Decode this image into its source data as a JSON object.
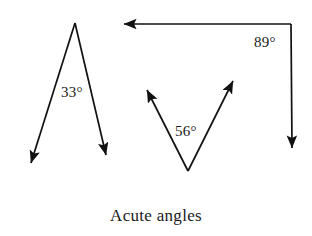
{
  "figure": {
    "caption": "Acute angles",
    "background_color": "#ffffff",
    "stroke_color": "#111111",
    "text_color": "#1a1a1a",
    "width": 312,
    "height": 236
  },
  "angles": [
    {
      "id": "angle-33",
      "label": "33°",
      "value": 33,
      "unit": "degrees",
      "shape": "narrow-v-inverted",
      "vertex": {
        "x": 75,
        "y": 23
      },
      "rays": [
        {
          "name": "left-ray",
          "tip": {
            "x": 28,
            "y": 166
          },
          "arrowhead": true
        },
        {
          "name": "right-ray",
          "tip": {
            "x": 108,
            "y": 159
          },
          "arrowhead": true
        }
      ],
      "label_position": {
        "x": 61,
        "y": 85
      }
    },
    {
      "id": "angle-56",
      "label": "56°",
      "value": 56,
      "unit": "degrees",
      "shape": "v-upright",
      "vertex": {
        "x": 188,
        "y": 171
      },
      "rays": [
        {
          "name": "left-ray",
          "tip": {
            "x": 145,
            "y": 86
          },
          "arrowhead": true
        },
        {
          "name": "right-ray",
          "tip": {
            "x": 236,
            "y": 77
          },
          "arrowhead": true
        }
      ],
      "label_position": {
        "x": 175,
        "y": 124
      }
    },
    {
      "id": "angle-89",
      "label": "89°",
      "value": 89,
      "unit": "degrees",
      "shape": "near-right-angle",
      "vertex": {
        "x": 291,
        "y": 24
      },
      "rays": [
        {
          "name": "horizontal-ray",
          "tip": {
            "x": 119,
            "y": 24
          },
          "arrowhead": true
        },
        {
          "name": "vertical-ray",
          "tip": {
            "x": 292,
            "y": 153
          },
          "arrowhead": true
        }
      ],
      "label_position": {
        "x": 254,
        "y": 35
      }
    }
  ]
}
